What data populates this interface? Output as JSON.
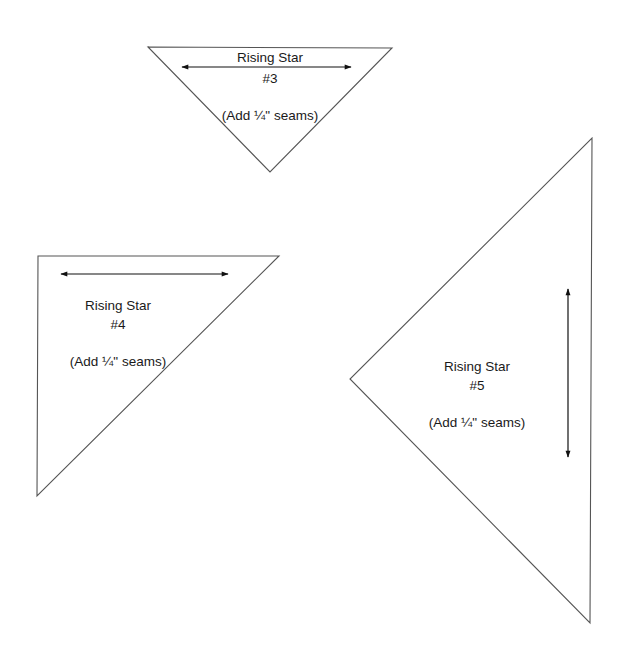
{
  "document": {
    "background": "#ffffff",
    "stroke_color": "#444444",
    "templates": [
      {
        "id": "rising-star-3",
        "title": "Rising Star",
        "number": "#3",
        "note": "(Add ¼\" seams)",
        "shape": "inverted isosceles right triangle",
        "vertices": [
          [
            148,
            47
          ],
          [
            392,
            48
          ],
          [
            270,
            172
          ]
        ],
        "grain_arrow": {
          "orientation": "horizontal",
          "from": [
            182,
            67
          ],
          "to": [
            351,
            67
          ]
        },
        "text_center_x": 270,
        "text_y": [
          58,
          79,
          116
        ]
      },
      {
        "id": "rising-star-4",
        "title": "Rising Star",
        "number": "#4",
        "note": "(Add ¼\" seams)",
        "shape": "right triangle, right angle at top-left",
        "vertices": [
          [
            38,
            256
          ],
          [
            279,
            256
          ],
          [
            37,
            496
          ]
        ],
        "grain_arrow": {
          "orientation": "horizontal",
          "from": [
            61,
            274
          ],
          "to": [
            228,
            274
          ]
        },
        "text_center_x": 118,
        "text_y": [
          306,
          325,
          362
        ]
      },
      {
        "id": "rising-star-5",
        "title": "Rising Star",
        "number": "#5",
        "note": "(Add ¼\" seams)",
        "shape": "isosceles right triangle, apex pointing left",
        "vertices": [
          [
            592,
            138
          ],
          [
            590,
            623
          ],
          [
            350,
            379
          ]
        ],
        "grain_arrow": {
          "orientation": "vertical",
          "from": [
            568,
            289
          ],
          "to": [
            568,
            457
          ]
        },
        "text_center_x": 477,
        "text_y": [
          367,
          386,
          423
        ]
      }
    ]
  }
}
